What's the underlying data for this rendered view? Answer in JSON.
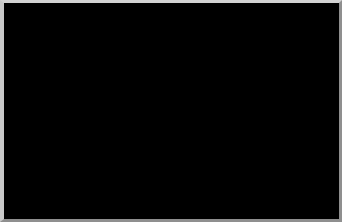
{
  "figure": {
    "type": "scanning-electron-micrograph",
    "background_color": "#030303",
    "frame_color": "#c9c9c9"
  },
  "annotations": {
    "fimbriae_label": "Fimbriae",
    "leader_color": "#b9b9b9"
  },
  "scale_bar": {
    "label": "1 µm",
    "color": "#f0f0f0",
    "length_px": 36
  },
  "cell": {
    "body_fill_dark": "#0d0d0d",
    "body_fill_mid": "#232323",
    "rim_color": "#6e6e6e",
    "fimbriae_color": "#d6d6d6"
  }
}
